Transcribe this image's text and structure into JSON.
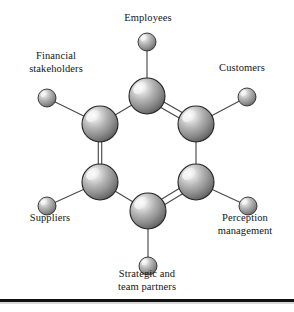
{
  "figure": {
    "background_color": "#ffffff",
    "line_color": "#4a4a4a",
    "sphere_light_color": "#f2f2f2",
    "sphere_mid_color": "#a8a8a8",
    "sphere_dark_color": "#4e4e4e",
    "sphere_outline_color": "#2b2b2b"
  },
  "nodes": [
    {
      "id": "employees",
      "label": "Employees",
      "hub_cx": 147,
      "hub_cy": 96,
      "hub_r": 18,
      "sat_cx": 147,
      "sat_cy": 42,
      "sat_r": 9
    },
    {
      "id": "financial",
      "label": "Financial\nstakeholders",
      "hub_cx": 100,
      "hub_cy": 124,
      "hub_r": 18,
      "sat_cx": 47,
      "sat_cy": 98,
      "sat_r": 9
    },
    {
      "id": "customers",
      "label": "Customers",
      "hub_cx": 196,
      "hub_cy": 124,
      "hub_r": 18,
      "sat_cx": 247,
      "sat_cy": 97,
      "sat_r": 9
    },
    {
      "id": "suppliers",
      "label": "Suppliers",
      "hub_cx": 100,
      "hub_cy": 182,
      "hub_r": 18,
      "sat_cx": 47,
      "sat_cy": 206,
      "sat_r": 9
    },
    {
      "id": "perception",
      "label": "Perception\nmanagement",
      "hub_cx": 196,
      "hub_cy": 182,
      "hub_r": 18,
      "sat_cx": 248,
      "sat_cy": 206,
      "sat_r": 9
    },
    {
      "id": "strategic",
      "label": "Strategic and\nteam partners",
      "hub_cx": 148,
      "hub_cy": 211,
      "hub_r": 18,
      "sat_cx": 148,
      "sat_cy": 266,
      "sat_r": 9
    }
  ],
  "bonds": [
    {
      "from": "employees",
      "to": "financial",
      "type": "single"
    },
    {
      "from": "employees",
      "to": "customers",
      "type": "double"
    },
    {
      "from": "customers",
      "to": "perception",
      "type": "single"
    },
    {
      "from": "perception",
      "to": "strategic",
      "type": "double"
    },
    {
      "from": "strategic",
      "to": "suppliers",
      "type": "single"
    },
    {
      "from": "suppliers",
      "to": "financial",
      "type": "double"
    }
  ],
  "labels": {
    "employees": "Employees",
    "financial": "Financial\nstakeholders",
    "customers": "Customers",
    "suppliers": "Suppliers",
    "perception": "Perception\nmanagement",
    "strategic": "Strategic and\nteam partners"
  },
  "rule": {
    "present": true,
    "color": "#111111"
  }
}
